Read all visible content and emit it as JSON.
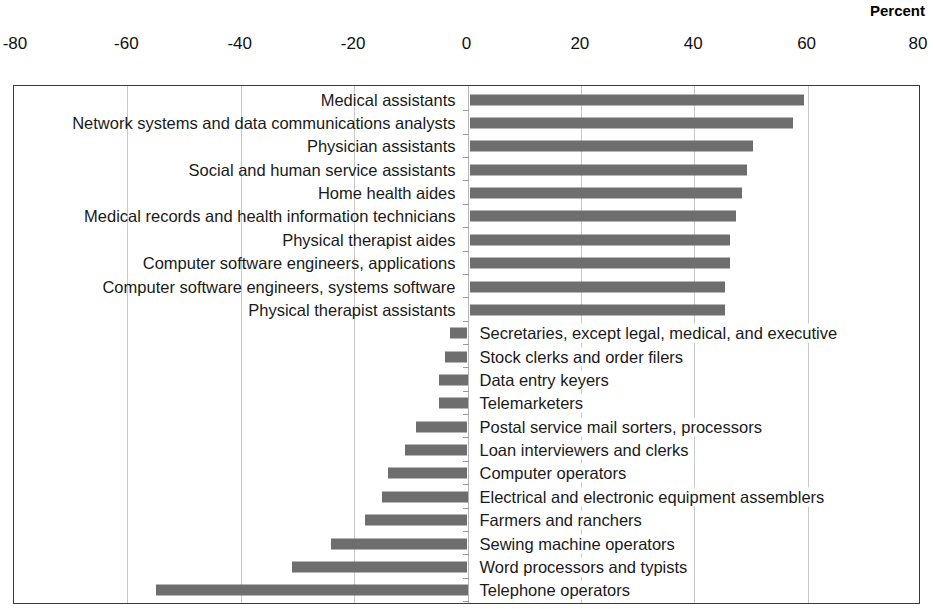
{
  "chart_data": {
    "type": "bar",
    "orientation": "horizontal",
    "title": "",
    "subtitle": "",
    "xlabel": "Percent",
    "ylabel": "",
    "xlim": [
      -80,
      80
    ],
    "xticks": [
      -80,
      -60,
      -40,
      -20,
      0,
      20,
      40,
      60,
      80
    ],
    "xtick_labels": [
      "-80",
      "-60",
      "-40",
      "-20",
      "0",
      "20",
      "40",
      "60",
      "80"
    ],
    "grid": true,
    "legend": "none",
    "bar_color": "#6e6e6e",
    "axis_color": "#3a3a3a",
    "gridline_color": "#c8c8c8",
    "categories": [
      "Medical assistants",
      "Network systems and data communications analysts",
      "Physician assistants",
      "Social and human service assistants",
      "Home health aides",
      "Medical records and health information technicians",
      "Physical therapist aides",
      "Computer software engineers, applications",
      "Computer software engineers, systems software",
      "Physical therapist assistants",
      "Secretaries, except legal, medical, and executive",
      "Stock clerks and order filers",
      "Data entry keyers",
      "Telemarketers",
      "Postal service mail sorters, processors",
      "Loan interviewers and clerks",
      "Computer operators",
      "Electrical and electronic equipment assemblers",
      "Farmers and ranchers",
      "Sewing machine operators",
      "Word processors and typists",
      "Telephone operators"
    ],
    "values": [
      59,
      57,
      50,
      49,
      48,
      47,
      46,
      46,
      45,
      45,
      -3,
      -4,
      -5,
      -5,
      -9,
      -11,
      -14,
      -15,
      -18,
      -24,
      -31,
      -55
    ]
  },
  "axis": {
    "percent_header": "Percent"
  }
}
